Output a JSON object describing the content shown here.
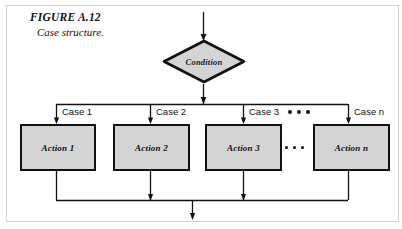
{
  "figure": {
    "title": "FIGURE A.12",
    "subtitle": "Case structure."
  },
  "diagram": {
    "type": "flowchart",
    "name": "case-structure",
    "decision": {
      "label": "Condition",
      "shape": "diamond",
      "fill": "#d4d4d4",
      "stroke": "#111111"
    },
    "branches": [
      {
        "case_label": "Case 1",
        "action_label": "Action 1"
      },
      {
        "case_label": "Case 2",
        "action_label": "Action 2"
      },
      {
        "case_label": "Case 3",
        "action_label": "Action 3"
      },
      {
        "case_label": "Case n",
        "action_label": "Action n"
      }
    ],
    "ellipsis_marks": [
      {
        "position": "between-case-3-and-case-n",
        "dots": 3
      },
      {
        "position": "between-action-3-and-action-n",
        "dots": 3
      }
    ],
    "entry_arrow": true,
    "exit_arrow": true,
    "colors": {
      "box_fill": "#d4d4d4",
      "stroke": "#111111",
      "background": "#ffffff"
    }
  }
}
